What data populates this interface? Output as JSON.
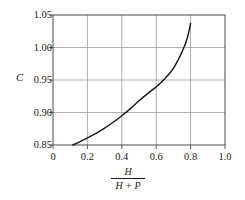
{
  "chart_data": {
    "type": "line",
    "title": "",
    "xlabel": "H / (H + P)",
    "xlabel_numerator": "H",
    "xlabel_denominator": "H + P",
    "ylabel": "C",
    "xlim": [
      0,
      1.0
    ],
    "ylim": [
      0.85,
      1.05
    ],
    "grid": true,
    "legend": "none",
    "x_ticks": [
      "0",
      "0.2",
      "0.4",
      "0.6",
      "0.8",
      "1.0"
    ],
    "x_tick_values": [
      0,
      0.2,
      0.4,
      0.6,
      0.8,
      1.0
    ],
    "y_ticks": [
      "0.85",
      "0.90",
      "0.95",
      "1.00",
      "1.05"
    ],
    "y_tick_values": [
      0.85,
      0.9,
      0.95,
      1.0,
      1.05
    ],
    "series": [
      {
        "name": "C",
        "x": [
          0.115,
          0.15,
          0.2,
          0.25,
          0.3,
          0.35,
          0.4,
          0.45,
          0.5,
          0.55,
          0.6,
          0.65,
          0.7,
          0.75,
          0.78,
          0.8
        ],
        "values": [
          0.85,
          0.854,
          0.861,
          0.868,
          0.876,
          0.885,
          0.895,
          0.906,
          0.918,
          0.929,
          0.9395,
          0.952,
          0.968,
          0.993,
          1.014,
          1.037
        ]
      }
    ]
  },
  "colors": {
    "background": "#ffffff",
    "curve": "#1a1a1a",
    "axis": "#595959",
    "grid": "#8c8c8c",
    "text": "#1a1a1a"
  }
}
